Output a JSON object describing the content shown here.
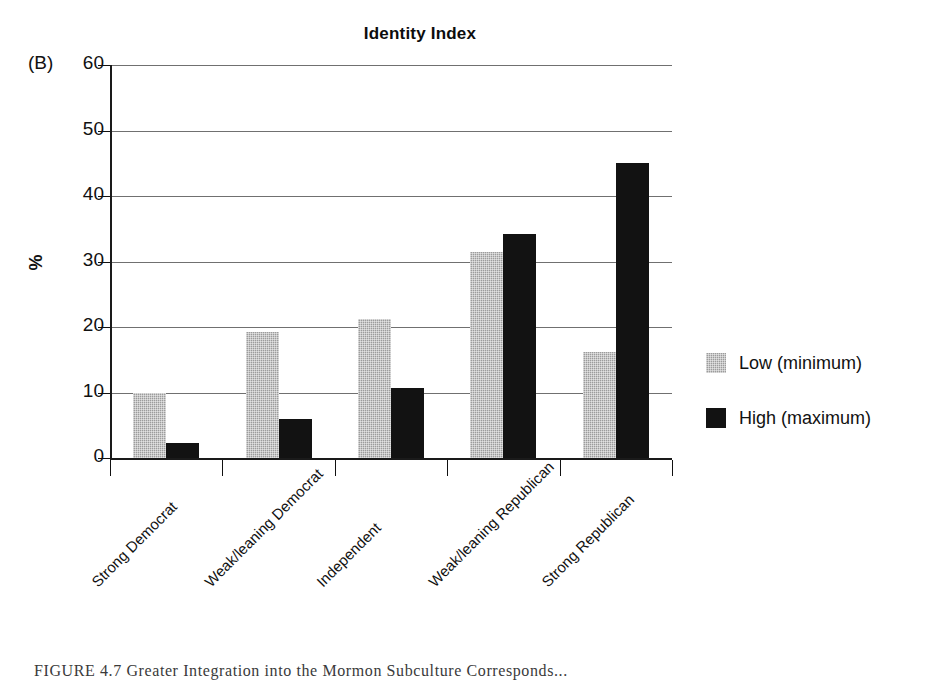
{
  "panel": {
    "label": "(B)"
  },
  "title": "Identity Index",
  "axes": {
    "ylabel": "%",
    "yticks": [
      "60",
      "50",
      "40",
      "30",
      "20",
      "10",
      "0"
    ]
  },
  "legend": {
    "items": [
      {
        "label": "Low (minimum)",
        "color": "#9c9c9c",
        "key": "low"
      },
      {
        "label": "High (maximum)",
        "color": "#121212",
        "key": "high"
      }
    ]
  },
  "caption": {
    "figure_number": "FIGURE 4.7",
    "text": "Greater Integration into the Mormon Subculture Corresponds..."
  },
  "chart_data": {
    "type": "bar",
    "title": "Identity Index",
    "xlabel": "",
    "ylabel": "%",
    "ylim": [
      0,
      60
    ],
    "ytick_step": 10,
    "grid": true,
    "legend_position": "right",
    "categories": [
      "Strong Democrat",
      "Weak/leaning Democrat",
      "Independent",
      "Weak/leaning Republican",
      "Strong Republican"
    ],
    "series": [
      {
        "name": "Low (minimum)",
        "color": "#9c9c9c",
        "values": [
          10.0,
          19.3,
          21.3,
          31.5,
          16.2
        ]
      },
      {
        "name": "High (maximum)",
        "color": "#121212",
        "values": [
          2.3,
          6.0,
          10.7,
          34.2,
          45.0
        ]
      }
    ]
  }
}
